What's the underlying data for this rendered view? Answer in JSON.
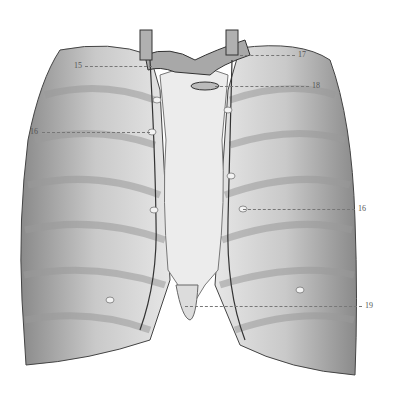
{
  "figure": {
    "labels": [
      {
        "id": "15",
        "text": "15",
        "x": 74,
        "y": 62,
        "line_x1": 85,
        "line_x2": 152,
        "line_y": 66
      },
      {
        "id": "16-left",
        "text": "16",
        "x": 30,
        "y": 128,
        "line_x1": 42,
        "line_x2": 150,
        "line_y": 132
      },
      {
        "id": "17",
        "text": "17",
        "x": 298,
        "y": 51,
        "line_x1": 240,
        "line_x2": 295,
        "line_y": 55
      },
      {
        "id": "18",
        "text": "18",
        "x": 312,
        "y": 82,
        "line_x1": 215,
        "line_x2": 309,
        "line_y": 86
      },
      {
        "id": "16-right",
        "text": "16",
        "x": 358,
        "y": 205,
        "line_x1": 243,
        "line_x2": 355,
        "line_y": 209
      },
      {
        "id": "19",
        "text": "19",
        "x": 365,
        "y": 302,
        "line_x1": 185,
        "line_x2": 362,
        "line_y": 306
      }
    ]
  }
}
